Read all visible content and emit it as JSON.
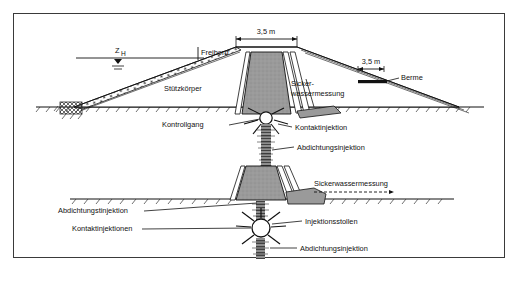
{
  "figure": {
    "title_caption": "",
    "border_color": "#3a3a3a",
    "background": "#ffffff",
    "core_fill": "#9a9a9a",
    "line_color": "#111111"
  },
  "upper_section": {
    "water_level_label": "Z",
    "water_level_sub": "H",
    "freibord_label": "Freibord",
    "crest_width_label": "3,5 m",
    "berme_width_label": "3,5 m",
    "berme_label": "Berme",
    "stuetzkoerper_label": "Stützkörper",
    "sickerwasser_line1": "Sicker-",
    "sickerwasser_line2": "wassermessung",
    "kontrollgang_label": "Kontrollgang",
    "kontaktinjektion_label": "Kontaktinjektion",
    "abdichtungsinjektion_label": "Abdichtungsinjektion"
  },
  "lower_section": {
    "sickerwassermessung_label": "Sickerwassermessung",
    "abdichtungstinjektion_label": "Abdichtungstinjektion",
    "kontaktinjektionen_label": "Kontaktinjektionen",
    "injektionsstollen_label": "Injektionsstollen",
    "abdichtungsinjektion_label": "Abdichtungsinjektion"
  }
}
